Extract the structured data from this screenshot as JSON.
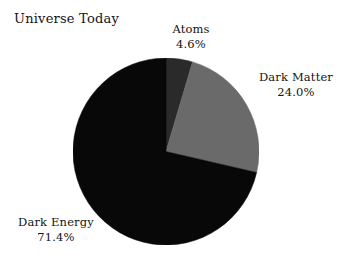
{
  "chart": {
    "title": "Universe Today"
  },
  "chart_data": {
    "type": "pie",
    "title": "Universe Today",
    "xlabel": "",
    "ylabel": "",
    "legend": "none",
    "grid": false,
    "start_angle_deg": 0,
    "direction": "clockwise",
    "units": "percent",
    "categories": [
      "Atoms",
      "Dark Matter",
      "Dark Energy"
    ],
    "values": [
      4.6,
      24.0,
      71.4
    ],
    "labels": [
      "4.6%",
      "24.0%",
      "71.4%"
    ],
    "colors": [
      "#2a2a2a",
      "#6a6a6a",
      "#080808"
    ],
    "slices": [
      {
        "name": "Atoms",
        "value": 4.6,
        "value_label": "4.6%",
        "color": "#2a2a2a",
        "start_deg": 0.0,
        "end_deg": 16.6,
        "label_position": "top"
      },
      {
        "name": "Dark Matter",
        "value": 24.0,
        "value_label": "24.0%",
        "color": "#6a6a6a",
        "start_deg": 16.6,
        "end_deg": 103.0,
        "label_position": "right"
      },
      {
        "name": "Dark Energy",
        "value": 71.4,
        "value_label": "71.4%",
        "color": "#080808",
        "start_deg": 103.0,
        "end_deg": 360.0,
        "label_position": "bottom-left"
      }
    ]
  },
  "labels": {
    "atoms": {
      "name": "Atoms",
      "value": "4.6%"
    },
    "dark_matter": {
      "name": "Dark Matter",
      "value": "24.0%"
    },
    "dark_energy": {
      "name": "Dark Energy",
      "value": "71.4%"
    }
  }
}
